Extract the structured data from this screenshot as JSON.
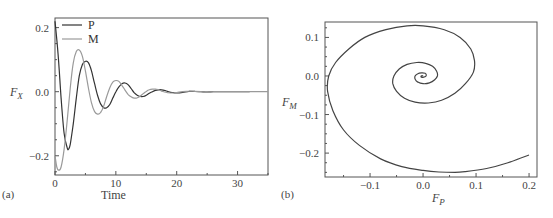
{
  "chart_data": [
    {
      "type": "line",
      "panel_label": "(a)",
      "xlabel": "Time",
      "ylabel": "F",
      "ylabel_sub": "X",
      "xlim": [
        0,
        35
      ],
      "ylim": [
        -0.26,
        0.23
      ],
      "xticks": [
        0,
        10,
        20,
        30
      ],
      "xtick_labels": [
        "0",
        "10",
        "20",
        "30"
      ],
      "yticks": [
        0.2,
        0.0,
        -0.2
      ],
      "ytick_labels": [
        "0.2",
        "0.0",
        "−0.2"
      ],
      "grid": false,
      "legend_position": "upper left",
      "series": [
        {
          "name": "P",
          "color": "#333333",
          "x": [
            0,
            0.5,
            1,
            1.5,
            2,
            2.2,
            2.5,
            3,
            3.5,
            4,
            4.5,
            5,
            5.5,
            6,
            6.5,
            7,
            7.5,
            8,
            8.5,
            9,
            9.5,
            10,
            10.5,
            11,
            11.5,
            12,
            12.5,
            13,
            13.5,
            14,
            14.5,
            15,
            15.5,
            16,
            16.5,
            17,
            17.5,
            18,
            18.5,
            19,
            19.5,
            20,
            21,
            22,
            23,
            24,
            25,
            26,
            27,
            28,
            29,
            30,
            31,
            32
          ],
          "values": [
            0.22,
            0.12,
            -0.02,
            -0.13,
            -0.175,
            -0.18,
            -0.165,
            -0.1,
            -0.02,
            0.05,
            0.085,
            0.095,
            0.09,
            0.065,
            0.025,
            -0.012,
            -0.038,
            -0.05,
            -0.05,
            -0.04,
            -0.02,
            0.0,
            0.015,
            0.025,
            0.027,
            0.022,
            0.01,
            -0.003,
            -0.011,
            -0.015,
            -0.015,
            -0.011,
            -0.005,
            0.0,
            0.004,
            0.006,
            0.006,
            0.004,
            0.001,
            -0.002,
            -0.003,
            -0.004,
            -0.002,
            0.001,
            0.001,
            0.0,
            -0.001,
            0.0,
            0.0,
            0.0,
            0.0,
            0.0,
            0.0,
            0.0
          ]
        },
        {
          "name": "M",
          "color": "#9a9a9a",
          "x": [
            0,
            0.3,
            0.6,
            1,
            1.5,
            2,
            2.5,
            3,
            3.5,
            4,
            4.5,
            5,
            5.5,
            6,
            6.5,
            7,
            7.5,
            8,
            8.5,
            9,
            9.5,
            10,
            10.5,
            11,
            11.5,
            12,
            12.5,
            13,
            13.5,
            14,
            14.5,
            15,
            15.5,
            16,
            16.5,
            17,
            17.5,
            18,
            18.5,
            19,
            19.5,
            20,
            21,
            22,
            23,
            24,
            25,
            26,
            27,
            28,
            29,
            30,
            31,
            32,
            33,
            34,
            35
          ],
          "values": [
            -0.2,
            -0.235,
            -0.245,
            -0.235,
            -0.18,
            -0.09,
            0.01,
            0.09,
            0.125,
            0.13,
            0.11,
            0.065,
            0.01,
            -0.035,
            -0.062,
            -0.07,
            -0.065,
            -0.045,
            -0.015,
            0.012,
            0.03,
            0.035,
            0.032,
            0.02,
            0.005,
            -0.008,
            -0.016,
            -0.02,
            -0.019,
            -0.014,
            -0.006,
            0.001,
            0.006,
            0.008,
            0.008,
            0.006,
            0.002,
            -0.001,
            -0.003,
            -0.004,
            -0.004,
            -0.003,
            0.0,
            0.002,
            0.001,
            0.0,
            -0.001,
            0.0,
            0.0,
            0.0,
            0.0,
            0.0,
            0.0,
            0.0,
            0.0,
            0.0,
            0.0
          ]
        }
      ]
    },
    {
      "type": "line",
      "panel_label": "(b)",
      "xlabel": "F",
      "xlabel_sub": "P",
      "ylabel": "F",
      "ylabel_sub": "M",
      "xlim": [
        -0.185,
        0.215
      ],
      "ylim": [
        -0.262,
        0.14
      ],
      "xticks": [
        -0.1,
        0.0,
        0.1,
        0.2
      ],
      "xtick_labels": [
        "−0.1",
        "0.0",
        "0.1",
        "0.2"
      ],
      "yticks": [
        0.1,
        0.0,
        -0.1,
        -0.2
      ],
      "ytick_labels": [
        "0.1",
        "0.0",
        "−0.1",
        "−0.2"
      ],
      "grid": false,
      "series": [
        {
          "name": "phase trajectory",
          "color": "#444444",
          "x": [
            0.2,
            0.16,
            0.12,
            0.08,
            0.06,
            0.03,
            0.0,
            -0.04,
            -0.08,
            -0.12,
            -0.15,
            -0.17,
            -0.18,
            -0.178,
            -0.165,
            -0.14,
            -0.11,
            -0.07,
            -0.03,
            0.0,
            0.04,
            0.07,
            0.09,
            0.097,
            0.095,
            0.08,
            0.06,
            0.035,
            0.01,
            -0.015,
            -0.035,
            -0.05,
            -0.057,
            -0.055,
            -0.045,
            -0.03,
            -0.012,
            0.005,
            0.018,
            0.026,
            0.027,
            0.022,
            0.012,
            0.0,
            -0.01,
            -0.015,
            -0.015,
            -0.01,
            -0.003,
            0.004,
            0.006,
            0.005,
            0.001,
            -0.003,
            -0.004,
            -0.002,
            0.0
          ],
          "y": [
            -0.205,
            -0.225,
            -0.24,
            -0.248,
            -0.25,
            -0.249,
            -0.245,
            -0.235,
            -0.215,
            -0.18,
            -0.14,
            -0.09,
            -0.04,
            0.0,
            0.035,
            0.07,
            0.1,
            0.12,
            0.13,
            0.13,
            0.12,
            0.1,
            0.07,
            0.04,
            0.01,
            -0.02,
            -0.045,
            -0.063,
            -0.07,
            -0.068,
            -0.058,
            -0.04,
            -0.02,
            0.0,
            0.018,
            0.03,
            0.035,
            0.033,
            0.025,
            0.012,
            0.0,
            -0.01,
            -0.018,
            -0.02,
            -0.016,
            -0.008,
            0.0,
            0.006,
            0.008,
            0.007,
            0.003,
            -0.001,
            -0.003,
            -0.003,
            -0.001,
            0.001,
            0.0
          ]
        }
      ]
    }
  ]
}
